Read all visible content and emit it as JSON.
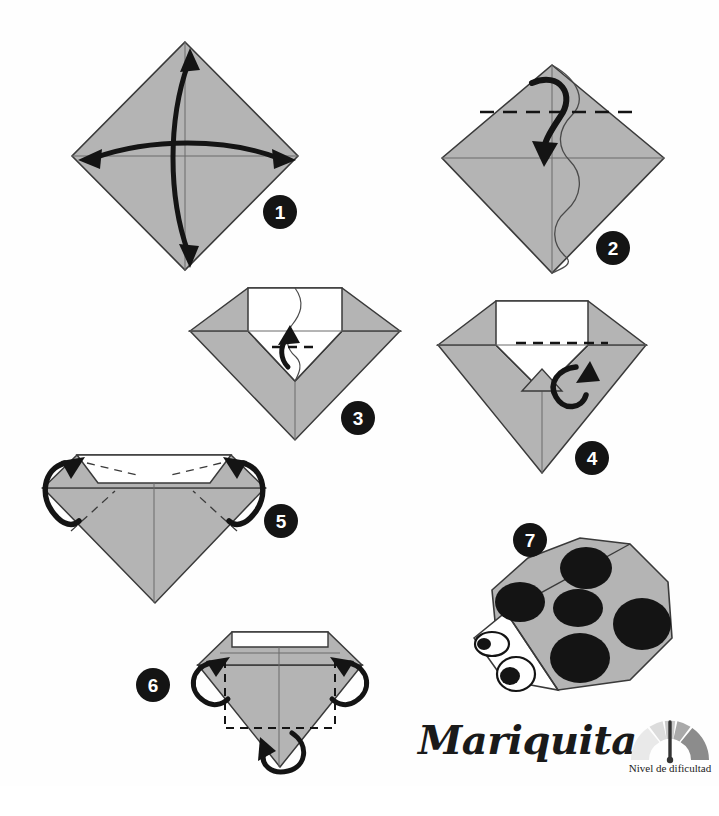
{
  "page": {
    "title": "Mariquita",
    "background_color": "#ffffff",
    "paper_fill": "#b4b4b4",
    "paper_fill_light": "#c2c2c2",
    "paper_outline": "#3a3a3a",
    "white_fill": "#ffffff",
    "ink_color": "#141414"
  },
  "difficulty": {
    "label": "Nivel de dificultad",
    "segments": 5,
    "level": 3,
    "segment_colors": [
      "#e9e9e9",
      "#dcdcdc",
      "#c9c9c9",
      "#a9a9a9",
      "#8c8c8c"
    ],
    "needle_color": "#333333"
  },
  "steps": [
    {
      "number": "1",
      "name": "step-1",
      "caption": "Square folded to a diamond; crease both diagonals",
      "badge": {
        "x": 263,
        "y": 195
      }
    },
    {
      "number": "2",
      "name": "step-2",
      "caption": "Fold the top point down to the centre",
      "badge": {
        "x": 596,
        "y": 231
      }
    },
    {
      "number": "3",
      "name": "step-3",
      "caption": "Fold the small point back up",
      "badge": {
        "x": 341,
        "y": 401
      }
    },
    {
      "number": "4",
      "name": "step-4",
      "caption": "Turn the little flap over",
      "badge": {
        "x": 575,
        "y": 441
      }
    },
    {
      "number": "5",
      "name": "step-5",
      "caption": "Fold the two side corners behind",
      "badge": {
        "x": 264,
        "y": 504
      }
    },
    {
      "number": "6",
      "name": "step-6",
      "caption": "Fold the sides and the bottom tip behind",
      "badge": {
        "x": 136,
        "y": 668
      }
    },
    {
      "number": "7",
      "name": "step-7",
      "caption": "Finished ladybird",
      "badge": {
        "x": 513,
        "y": 523
      }
    }
  ],
  "ladybird": {
    "name": "ladybird-figure",
    "spot_count": 6,
    "eye_count": 2,
    "body_color": "#b4b4b4",
    "spot_color": "#141414",
    "head_color": "#ffffff"
  }
}
